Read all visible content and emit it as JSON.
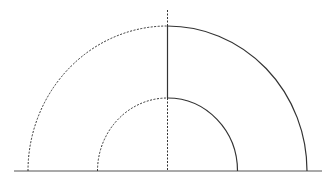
{
  "diagram": {
    "title": "",
    "colors": {
      "stroke": "#333333",
      "baseline": "#555555",
      "background": "#ffffff"
    },
    "center": {
      "x": 167.5,
      "y": 171
    },
    "baseline": {
      "x1": 14,
      "x2": 322,
      "y": 171
    },
    "outer_arc": {
      "rx": 139.5,
      "ry": 145,
      "left_style": "dashed",
      "right_style": "solid"
    },
    "inner_arc": {
      "rx": 70,
      "ry": 73,
      "left_style": "dashed",
      "right_style": "solid"
    },
    "axis": {
      "top_y": 10,
      "solid_segment": {
        "y1": 26,
        "y2": 98
      },
      "dashed_segments": [
        {
          "y1": 10,
          "y2": 26
        },
        {
          "y1": 98,
          "y2": 171
        }
      ]
    }
  }
}
